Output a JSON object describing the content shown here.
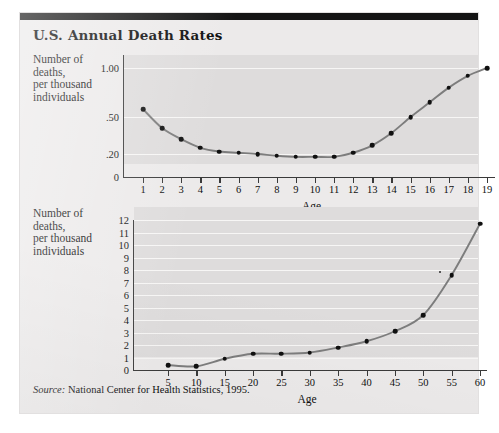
{
  "figure": {
    "title": "U.S. Annual Death Rates",
    "source_label": "Source:",
    "source_text": " National Center for Health Statistics, 1995."
  },
  "colors": {
    "page_background": "#ffffff",
    "card_background": "#eceaea",
    "plot_background": "#dedcdc",
    "rule_black": "#141414",
    "gridline_white": "#f7f6f5",
    "series_line": "#7d7d7d",
    "marker": "#101010",
    "text": "#101010"
  },
  "chart_data": [
    {
      "type": "line",
      "id": "childhood-death-rates",
      "title": "U.S. Annual Death Rates",
      "xlabel": "Age",
      "ylabel": "Number of deaths, per thousand individuals",
      "ylabel_lines": [
        "Number of",
        "deaths,",
        "per thousand",
        "individuals"
      ],
      "grid": true,
      "legend": "none",
      "xlim": [
        1,
        19
      ],
      "x": [
        1,
        2,
        3,
        4,
        5,
        6,
        7,
        8,
        9,
        10,
        11,
        12,
        13,
        14,
        15,
        16,
        17,
        18,
        19
      ],
      "xticks": [
        "1",
        "2",
        "3",
        "4",
        "5",
        "6",
        "7",
        "8",
        "9",
        "10",
        "11",
        "12",
        "13",
        "14",
        "15",
        "16",
        "17",
        "18",
        "19"
      ],
      "yticks": [
        "0",
        ".20",
        ".50",
        "1.00"
      ],
      "ytick_values": [
        0,
        0.2,
        0.5,
        1.0
      ],
      "values": [
        0.58,
        0.41,
        0.32,
        0.25,
        0.22,
        0.21,
        0.2,
        0.185,
        0.175,
        0.175,
        0.175,
        0.21,
        0.27,
        0.37,
        0.5,
        0.65,
        0.8,
        0.92,
        1.0
      ]
    },
    {
      "type": "line",
      "id": "adult-death-rates",
      "xlabel": "Age",
      "ylabel": "Number of deaths, per thousand individuals",
      "ylabel_lines": [
        "Number of",
        "deaths,",
        "per thousand",
        "individuals"
      ],
      "grid": true,
      "legend": "none",
      "xlim": [
        5,
        60
      ],
      "ylim": [
        0,
        12
      ],
      "x": [
        5,
        10,
        15,
        20,
        25,
        30,
        35,
        40,
        45,
        50,
        55,
        60
      ],
      "xticks": [
        "5",
        "10",
        "15",
        "20",
        "25",
        "30",
        "35",
        "40",
        "45",
        "50",
        "55",
        "60"
      ],
      "yticks": [
        "0",
        "1",
        "2",
        "3",
        "4",
        "5",
        "6",
        "7",
        "8",
        "9",
        "10",
        "11",
        "12"
      ],
      "values": [
        0.4,
        0.3,
        0.9,
        1.3,
        1.3,
        1.4,
        1.8,
        2.3,
        3.1,
        4.4,
        7.6,
        11.7
      ]
    }
  ]
}
